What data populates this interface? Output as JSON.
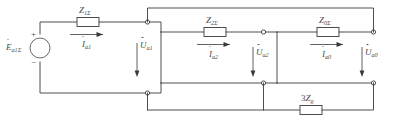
{
  "diagram": {
    "line_color": "#3a3a3a",
    "text_color": "#4a4a4a",
    "background": "#ffffff",
    "source": {
      "name": "emf-source",
      "symbol": "E",
      "subscript": "a1Σ",
      "plus_sign": "+",
      "minus_sign": "−"
    },
    "impedances": [
      {
        "name": "z1-sigma",
        "symbol": "Z",
        "subscript": "1Σ"
      },
      {
        "name": "z2-sigma",
        "symbol": "Z",
        "subscript": "2Σ"
      },
      {
        "name": "z0-sigma",
        "symbol": "Z",
        "subscript": "0Σ"
      },
      {
        "name": "three-zg",
        "prefix": "3",
        "symbol": "Z",
        "subscript": "g"
      }
    ],
    "currents": [
      {
        "name": "current-a1",
        "symbol": "I",
        "subscript": "a1"
      },
      {
        "name": "current-a2",
        "symbol": "I",
        "subscript": "a2"
      },
      {
        "name": "current-a0",
        "symbol": "I",
        "subscript": "a0"
      }
    ],
    "voltages": [
      {
        "name": "voltage-a1",
        "symbol": "U",
        "subscript": "a1"
      },
      {
        "name": "voltage-a2",
        "symbol": "U",
        "subscript": "a2"
      },
      {
        "name": "voltage-a0",
        "symbol": "U",
        "subscript": "a0"
      }
    ]
  }
}
